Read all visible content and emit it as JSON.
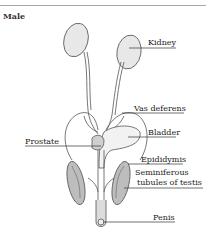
{
  "diagram": {
    "title": "Male",
    "labels": {
      "kidney": "Kidney",
      "vas_deferens": "Vas deferens",
      "prostate": "Prostate",
      "bladder": "Bladder",
      "epididymis": "Epididymis",
      "seminiferous_line1": "Seminiferous",
      "seminiferous_line2": "tubules of testis",
      "penis": "Penis"
    }
  }
}
